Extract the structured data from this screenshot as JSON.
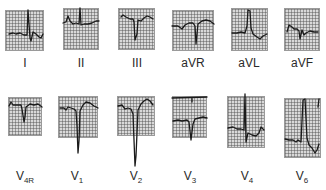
{
  "figure": {
    "type": "12-lead ECG strips",
    "rows": [
      {
        "leads": [
          {
            "id": "I",
            "label": "I",
            "sub": ""
          },
          {
            "id": "II",
            "label": "II",
            "sub": ""
          },
          {
            "id": "III",
            "label": "III",
            "sub": ""
          },
          {
            "id": "aVR",
            "label": "aVR",
            "sub": ""
          },
          {
            "id": "aVL",
            "label": "aVL",
            "sub": ""
          },
          {
            "id": "aVF",
            "label": "aVF",
            "sub": ""
          }
        ]
      },
      {
        "leads": [
          {
            "id": "V4R",
            "label": "V",
            "sub": "4R"
          },
          {
            "id": "V1",
            "label": "V",
            "sub": "1"
          },
          {
            "id": "V2",
            "label": "V",
            "sub": "2"
          },
          {
            "id": "V3",
            "label": "V",
            "sub": "3"
          },
          {
            "id": "V4",
            "label": "V",
            "sub": "4"
          },
          {
            "id": "V6",
            "label": "V",
            "sub": "6"
          }
        ]
      }
    ],
    "colors": {
      "grid_bg": "#d9d9d9",
      "grid_line": "#505050",
      "trace": "#1a1a1a",
      "label": "#2a2a2a"
    }
  }
}
